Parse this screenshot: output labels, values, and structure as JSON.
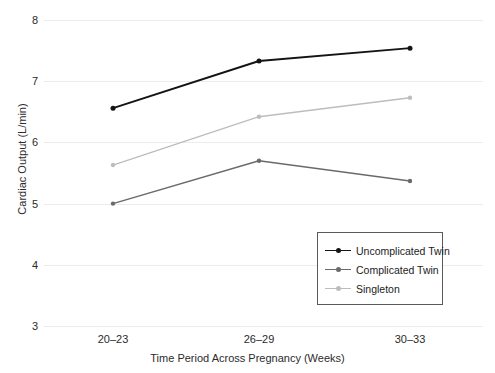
{
  "chart_data": {
    "type": "line",
    "title": "",
    "xlabel": "Time Period Across Pregnancy (Weeks)",
    "ylabel": "Cardiac Output (L/min)",
    "categories": [
      "20–23",
      "26–29",
      "30–33"
    ],
    "ylim": [
      3,
      8
    ],
    "yticks": [
      8,
      7,
      6,
      5,
      4,
      3
    ],
    "ytick_labels": [
      "8",
      "7",
      "6",
      "5",
      "4",
      "3"
    ],
    "grid": "horizontal",
    "legend_position": "lower-right-inside",
    "series": [
      {
        "name": "Uncomplicated Twin",
        "values": [
          6.56,
          7.33,
          7.54
        ],
        "color": "#141414",
        "linewidth": 1.9,
        "marker": "circle"
      },
      {
        "name": "Complicated Twin",
        "values": [
          5.0,
          5.7,
          5.37
        ],
        "color": "#6a6a6a",
        "linewidth": 1.4,
        "marker": "circle"
      },
      {
        "name": "Singleton",
        "values": [
          5.63,
          6.42,
          6.73
        ],
        "color": "#bdbdbd",
        "linewidth": 1.4,
        "marker": "circle"
      }
    ]
  },
  "axis": {
    "y_title": "Cardiac Output (L/min)",
    "x_title": "Time Period Across Pregnancy (Weeks)",
    "y_tick_0": "8",
    "y_tick_1": "7",
    "y_tick_2": "6",
    "y_tick_3": "5",
    "y_tick_4": "4",
    "y_tick_5": "3",
    "x_tick_0": "20–23",
    "x_tick_1": "26–29",
    "x_tick_2": "30–33"
  },
  "legend": {
    "items": [
      {
        "label": "Uncomplicated Twin",
        "color": "#141414"
      },
      {
        "label": "Complicated Twin",
        "color": "#6a6a6a"
      },
      {
        "label": "Singleton",
        "color": "#bdbdbd"
      }
    ]
  },
  "colors": {
    "gridline": "#ececec",
    "text": "#2b2b2b",
    "legend_border": "#5a5a5a",
    "background": "#ffffff"
  }
}
